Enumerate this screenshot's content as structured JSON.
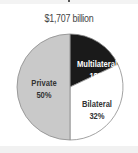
{
  "chart_data": {
    "type": "pie",
    "title": "$1,707 billion",
    "total_label": "$1,707 billion",
    "slices": [
      {
        "name": "Multilateral",
        "value": 18,
        "label": "Multilateral",
        "pct": "18%",
        "color": "#1a1a1a",
        "text_color": "#ffffff"
      },
      {
        "name": "Bilateral",
        "value": 32,
        "label": "Bilateral",
        "pct": "32%",
        "color": "#ffffff",
        "text_color": "#333333"
      },
      {
        "name": "Private",
        "value": 50,
        "label": "Private",
        "pct": "50%",
        "color": "#c9c9c9",
        "text_color": "#333333"
      }
    ],
    "start_angle_deg": 0,
    "direction": "clockwise",
    "legend": "none"
  },
  "colors": {
    "outline": "#8a8a8a",
    "background": "#ffffff"
  }
}
